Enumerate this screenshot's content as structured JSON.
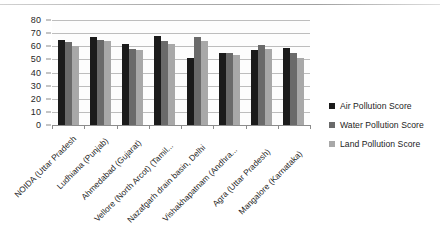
{
  "chart_data": {
    "type": "bar",
    "title": "",
    "subtitle": "",
    "xlabel": "",
    "ylabel": "",
    "ylim": [
      0,
      80
    ],
    "ytick_step": 10,
    "yticks": [
      80,
      70,
      60,
      50,
      40,
      30,
      20,
      10,
      0
    ],
    "grid": true,
    "grid_axis": "y",
    "legend_position": "right",
    "orientation": "vertical",
    "grouping": "clustered",
    "categories": [
      "NOIDA (Uttar Pradesh",
      "Ludhiana (Punjab)",
      "Ahmedabad (Gujarat)",
      "Vellore (North Arcot) (Tamil...",
      "Nazafgarh drain basin, Delhi",
      "Vishakhapatnam (Andhra...",
      "Agra (Uttar Pradesh)",
      "Mangalore (Karnataka)"
    ],
    "series": [
      {
        "name": "Air Pollution Score",
        "color": "#1b1b1b",
        "values": [
          65,
          67,
          62,
          68,
          51,
          55,
          57,
          59
        ]
      },
      {
        "name": "Water Pollution Score",
        "color": "#6a6a6a",
        "values": [
          63,
          65,
          58,
          64,
          67,
          55,
          61,
          55
        ]
      },
      {
        "name": "Land Pollution Score",
        "color": "#a8a8a8",
        "values": [
          60,
          64,
          57,
          62,
          64,
          53,
          58,
          51
        ]
      }
    ]
  },
  "legend": {
    "items": [
      {
        "label": "Air Pollution Score",
        "color": "#1b1b1b"
      },
      {
        "label": "Water Pollution Score",
        "color": "#6a6a6a"
      },
      {
        "label": "Land Pollution Score",
        "color": "#a8a8a8"
      }
    ]
  }
}
